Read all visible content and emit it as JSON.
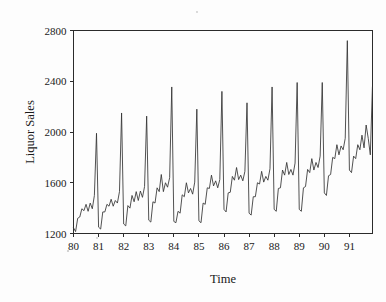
{
  "chart_data": {
    "type": "line",
    "title": "",
    "xlabel": "Time",
    "ylabel": "Liquor Sales",
    "xlim": [
      1980.0,
      1991.92
    ],
    "ylim": [
      1200,
      2800
    ],
    "ytick_labels": [
      "1200",
      "1600",
      "2000",
      "2400",
      "2800"
    ],
    "ytick_values": [
      1200,
      1600,
      2000,
      2400,
      2800
    ],
    "xtick_labels": [
      "80",
      "81",
      "82",
      "83",
      "84",
      "85",
      "86",
      "87",
      "88",
      "89",
      "90",
      "91"
    ],
    "xtick_values": [
      1980,
      1981,
      1982,
      1983,
      1984,
      1985,
      1986,
      1987,
      1988,
      1989,
      1990,
      1991
    ],
    "grid": false,
    "legend": false,
    "line_color": "#333333",
    "background_color": "#fdfdfd",
    "axis_color": "#2b2b2b",
    "series": [
      {
        "name": "Liquor Sales",
        "x": [
          1980.0,
          1980.083,
          1980.167,
          1980.25,
          1980.333,
          1980.417,
          1980.5,
          1980.583,
          1980.667,
          1980.75,
          1980.833,
          1980.917,
          1981.0,
          1981.083,
          1981.167,
          1981.25,
          1981.333,
          1981.417,
          1981.5,
          1981.583,
          1981.667,
          1981.75,
          1981.833,
          1981.917,
          1982.0,
          1982.083,
          1982.167,
          1982.25,
          1982.333,
          1982.417,
          1982.5,
          1982.583,
          1982.667,
          1982.75,
          1982.833,
          1982.917,
          1983.0,
          1983.083,
          1983.167,
          1983.25,
          1983.333,
          1983.417,
          1983.5,
          1983.583,
          1983.667,
          1983.75,
          1983.833,
          1983.917,
          1984.0,
          1984.083,
          1984.167,
          1984.25,
          1984.333,
          1984.417,
          1984.5,
          1984.583,
          1984.667,
          1984.75,
          1984.833,
          1984.917,
          1985.0,
          1985.083,
          1985.167,
          1985.25,
          1985.333,
          1985.417,
          1985.5,
          1985.583,
          1985.667,
          1985.75,
          1985.833,
          1985.917,
          1986.0,
          1986.083,
          1986.167,
          1986.25,
          1986.333,
          1986.417,
          1986.5,
          1986.583,
          1986.667,
          1986.75,
          1986.833,
          1986.917,
          1987.0,
          1987.083,
          1987.167,
          1987.25,
          1987.333,
          1987.417,
          1987.5,
          1987.583,
          1987.667,
          1987.75,
          1987.833,
          1987.917,
          1988.0,
          1988.083,
          1988.167,
          1988.25,
          1988.333,
          1988.417,
          1988.5,
          1988.583,
          1988.667,
          1988.75,
          1988.833,
          1988.917,
          1989.0,
          1989.083,
          1989.167,
          1989.25,
          1989.333,
          1989.417,
          1989.5,
          1989.583,
          1989.667,
          1989.75,
          1989.833,
          1989.917,
          1990.0,
          1990.083,
          1990.167,
          1990.25,
          1990.333,
          1990.417,
          1990.5,
          1990.583,
          1990.667,
          1990.75,
          1990.833,
          1990.917,
          1991.0,
          1991.083,
          1991.167,
          1991.25,
          1991.333,
          1991.417,
          1991.5,
          1991.583,
          1991.667,
          1991.75,
          1991.833,
          1991.917
        ],
        "values": [
          1245,
          1215,
          1320,
          1330,
          1395,
          1380,
          1430,
          1375,
          1440,
          1395,
          1500,
          1990,
          1250,
          1235,
          1370,
          1370,
          1430,
          1415,
          1470,
          1415,
          1460,
          1440,
          1530,
          2150,
          1275,
          1260,
          1420,
          1400,
          1500,
          1450,
          1530,
          1460,
          1535,
          1485,
          1570,
          2125,
          1305,
          1290,
          1450,
          1440,
          1560,
          1530,
          1665,
          1530,
          1600,
          1565,
          1640,
          2355,
          1295,
          1285,
          1375,
          1360,
          1505,
          1490,
          1600,
          1520,
          1555,
          1510,
          1605,
          2180,
          1300,
          1285,
          1440,
          1430,
          1560,
          1555,
          1660,
          1575,
          1615,
          1560,
          1625,
          2320,
          1390,
          1370,
          1520,
          1525,
          1650,
          1620,
          1720,
          1625,
          1660,
          1615,
          1690,
          2230,
          1360,
          1345,
          1490,
          1490,
          1600,
          1590,
          1690,
          1605,
          1650,
          1620,
          1710,
          2355,
          1390,
          1375,
          1555,
          1560,
          1700,
          1660,
          1760,
          1665,
          1705,
          1660,
          1755,
          2390,
          1390,
          1375,
          1560,
          1570,
          1705,
          1680,
          1790,
          1700,
          1760,
          1720,
          1810,
          2390,
          1520,
          1500,
          1655,
          1665,
          1800,
          1790,
          1900,
          1820,
          1890,
          1860,
          1950,
          2720,
          1700,
          1680,
          1810,
          1790,
          1900,
          1860,
          1975,
          1875,
          2055,
          1950,
          1820,
          2355
        ]
      }
    ]
  },
  "axis": {
    "ylabel": "Liquor Sales",
    "xlabel": "Time"
  }
}
